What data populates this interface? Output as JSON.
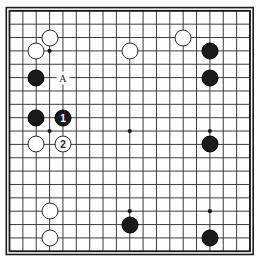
{
  "diagram": {
    "board": {
      "size": 19,
      "grid_line_color": "#3a3a3a",
      "border_color": "#1a1a1a",
      "background_color": "#ffffff",
      "star_point_color": "#1a1a1a",
      "star_points": [
        {
          "col": 3,
          "row": 3
        },
        {
          "col": 9,
          "row": 3
        },
        {
          "col": 15,
          "row": 3
        },
        {
          "col": 3,
          "row": 9
        },
        {
          "col": 9,
          "row": 9
        },
        {
          "col": 15,
          "row": 9
        },
        {
          "col": 3,
          "row": 15
        },
        {
          "col": 9,
          "row": 15
        },
        {
          "col": 15,
          "row": 15
        }
      ]
    },
    "colors": {
      "black_stone": "#1a1a1a",
      "white_stone": "#ffffff",
      "stone_outline": "#2b2b2b",
      "black_label_text": "#ffffff",
      "white_label_text": "#1a1a1a"
    },
    "stones": [
      {
        "color": "white",
        "col": 3,
        "row": 2,
        "label": ""
      },
      {
        "color": "white",
        "col": 2,
        "row": 3,
        "label": ""
      },
      {
        "color": "white",
        "col": 9,
        "row": 3,
        "label": ""
      },
      {
        "color": "white",
        "col": 13,
        "row": 2,
        "label": ""
      },
      {
        "color": "black",
        "col": 15,
        "row": 3,
        "label": ""
      },
      {
        "color": "black",
        "col": 2,
        "row": 5,
        "label": ""
      },
      {
        "color": "black",
        "col": 15,
        "row": 5,
        "label": ""
      },
      {
        "color": "black",
        "col": 2,
        "row": 8,
        "label": ""
      },
      {
        "color": "black",
        "col": 4,
        "row": 8,
        "label": "1"
      },
      {
        "color": "white",
        "col": 2,
        "row": 10,
        "label": ""
      },
      {
        "color": "white",
        "col": 4,
        "row": 10,
        "label": "2"
      },
      {
        "color": "black",
        "col": 15,
        "row": 10,
        "label": ""
      },
      {
        "color": "white",
        "col": 3,
        "row": 15,
        "label": ""
      },
      {
        "color": "black",
        "col": 9,
        "row": 16,
        "label": ""
      },
      {
        "color": "white",
        "col": 3,
        "row": 17,
        "label": ""
      },
      {
        "color": "black",
        "col": 15,
        "row": 17,
        "label": ""
      }
    ],
    "markers": [
      {
        "type": "letter",
        "text": "A",
        "col": 4,
        "row": 5
      }
    ]
  }
}
